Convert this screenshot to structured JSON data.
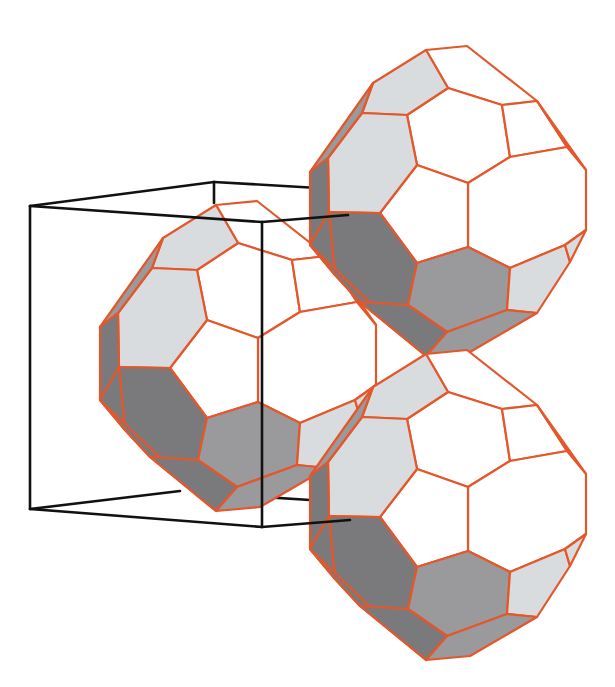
{
  "figure": {
    "title": "",
    "description": "Three polyhedral cages (truncated-icosahedron-like, hexagonal and pentagonal faces) packed against a wireframe unit cube",
    "width": 615,
    "height": 687,
    "background": "#ffffff"
  },
  "colors": {
    "edge": "#e4572a",
    "face_white": "#ffffff",
    "face_light": "#d8dcdf",
    "face_mid": "#9a9a9c",
    "face_dark": "#7a7a7c",
    "cube": "#111111"
  },
  "cube": {
    "name": "unit-cell-cube",
    "stroke_width": 2.6,
    "edges": [
      [
        [
          30,
          206
        ],
        [
          214,
          182
        ]
      ],
      [
        [
          214,
          182
        ],
        [
          318,
          188
        ]
      ],
      [
        [
          30,
          206
        ],
        [
          262,
          222
        ]
      ],
      [
        [
          262,
          222
        ],
        [
          348,
          215
        ]
      ],
      [
        [
          30,
          206
        ],
        [
          30,
          509
        ]
      ],
      [
        [
          262,
          222
        ],
        [
          262,
          527
        ]
      ],
      [
        [
          214,
          182
        ],
        [
          214,
          203
        ]
      ],
      [
        [
          30,
          509
        ],
        [
          262,
          527
        ]
      ],
      [
        [
          30,
          509
        ],
        [
          180,
          491
        ]
      ],
      [
        [
          262,
          527
        ],
        [
          350,
          520
        ]
      ],
      [
        [
          248,
          496
        ],
        [
          310,
          500
        ]
      ]
    ]
  },
  "polyhedron": {
    "name": "cage",
    "edge_width": 2.2,
    "vertices": {
      "a": [
        426,
        50
      ],
      "b": [
        467,
        46
      ],
      "c": [
        537,
        101
      ],
      "d": [
        448,
        88
      ],
      "e": [
        502,
        105
      ],
      "f": [
        373,
        83
      ],
      "g": [
        362,
        113
      ],
      "h": [
        407,
        115
      ],
      "i": [
        417,
        165
      ],
      "j": [
        468,
        183
      ],
      "k": [
        510,
        157
      ],
      "l": [
        567,
        147
      ],
      "m": [
        586,
        170
      ],
      "n": [
        586,
        230
      ],
      "o": [
        565,
        245
      ],
      "p": [
        510,
        268
      ],
      "q": [
        468,
        247
      ],
      "r": [
        380,
        213
      ],
      "s": [
        328,
        158
      ],
      "t": [
        310,
        172
      ],
      "u": [
        329,
        212
      ],
      "v": [
        310,
        245
      ],
      "w": [
        360,
        302
      ],
      "x": [
        408,
        305
      ],
      "y": [
        447,
        332
      ],
      "z": [
        507,
        310
      ],
      "aa": [
        537,
        313
      ],
      "ab": [
        570,
        262
      ],
      "ac": [
        426,
        356
      ],
      "ad": [
        417,
        263
      ],
      "ae": [
        335,
        275
      ],
      "af": [
        470,
        352
      ]
    },
    "faces": [
      {
        "v": [
          "a",
          "b",
          "c",
          "e",
          "d"
        ],
        "shade": "face_white"
      },
      {
        "v": [
          "d",
          "e",
          "k",
          "j",
          "i",
          "h"
        ],
        "shade": "face_white"
      },
      {
        "v": [
          "e",
          "c",
          "l",
          "k"
        ],
        "shade": "face_white"
      },
      {
        "v": [
          "c",
          "m",
          "l"
        ],
        "shade": "face_white"
      },
      {
        "v": [
          "k",
          "l",
          "m",
          "n",
          "o",
          "p",
          "q",
          "j"
        ],
        "shade": "face_white"
      },
      {
        "v": [
          "i",
          "j",
          "q",
          "ad",
          "r"
        ],
        "shade": "face_white"
      },
      {
        "v": [
          "f",
          "a",
          "d",
          "h",
          "g"
        ],
        "shade": "face_light"
      },
      {
        "v": [
          "g",
          "h",
          "i",
          "r",
          "u",
          "s"
        ],
        "shade": "face_light"
      },
      {
        "v": [
          "f",
          "g",
          "s",
          "t"
        ],
        "shade": "face_mid"
      },
      {
        "v": [
          "t",
          "s",
          "u",
          "v"
        ],
        "shade": "face_dark"
      },
      {
        "v": [
          "r",
          "ad",
          "x",
          "w",
          "ae",
          "u"
        ],
        "shade": "face_dark"
      },
      {
        "v": [
          "u",
          "ae",
          "v"
        ],
        "shade": "face_dark"
      },
      {
        "v": [
          "ad",
          "q",
          "p",
          "z",
          "y",
          "x"
        ],
        "shade": "face_mid"
      },
      {
        "v": [
          "p",
          "o",
          "ab",
          "aa",
          "z"
        ],
        "shade": "face_light"
      },
      {
        "v": [
          "o",
          "n",
          "ab"
        ],
        "shade": "face_light"
      },
      {
        "v": [
          "v",
          "ae",
          "w",
          "ac"
        ],
        "shade": "face_dark"
      },
      {
        "v": [
          "w",
          "x",
          "y",
          "ac"
        ],
        "shade": "face_dark"
      },
      {
        "v": [
          "y",
          "z",
          "aa",
          "af",
          "ac"
        ],
        "shade": "face_mid"
      }
    ],
    "instances": [
      {
        "name": "cage-left",
        "dx": -210,
        "dy": 155
      },
      {
        "name": "cage-top-right",
        "dx": 0,
        "dy": 0
      },
      {
        "name": "cage-bottom-right",
        "dx": 0,
        "dy": 304
      }
    ]
  }
}
